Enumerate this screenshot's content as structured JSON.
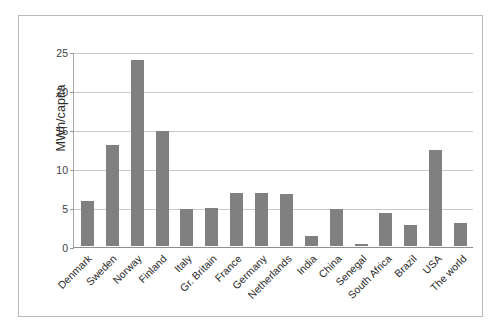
{
  "chart_data": {
    "type": "bar",
    "title": "",
    "xlabel": "",
    "ylabel": "MWh/capita",
    "ylim": [
      0,
      25
    ],
    "yticks": [
      0,
      5,
      10,
      15,
      20,
      25
    ],
    "grid": true,
    "legend": false,
    "bar_color": "#808080",
    "categories": [
      "Denmark",
      "Sweden",
      "Norway",
      "Finland",
      "Italy",
      "Gr. Britain",
      "France",
      "Germany",
      "Netherlands",
      "India",
      "China",
      "Senegal",
      "South Africa",
      "Brazil",
      "USA",
      "The world"
    ],
    "values": [
      5.8,
      12.9,
      23.9,
      14.7,
      4.8,
      4.9,
      6.8,
      6.8,
      6.7,
      1.3,
      4.7,
      0.2,
      4.2,
      2.7,
      12.3,
      2.9
    ]
  }
}
